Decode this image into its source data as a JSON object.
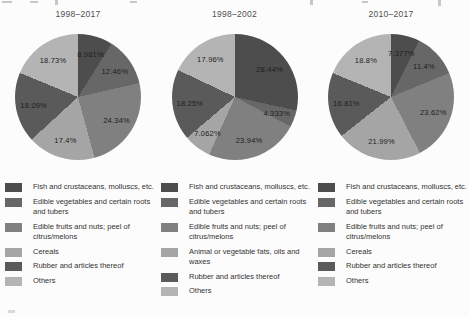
{
  "figure": {
    "background": "#fcfcfc",
    "text_color": "#333333",
    "title_color": "#4f4f4f"
  },
  "palette": {
    "fish": "#4d4d4d",
    "vegetables": "#676767",
    "fruits": "#808080",
    "light_category": "#a5a5a5",
    "rubber": "#5a5a5a",
    "others": "#b4b4b4"
  },
  "chart_data": [
    {
      "type": "pie",
      "title": "1998–2017",
      "categories": [
        "Fish and crustaceans, molluscs, etc.",
        "Edible vegetables and certain roots and tubers",
        "Edible fruits and nuts; peel of citrus/melons",
        "Cereals",
        "Rubber and articles thereof",
        "Others"
      ],
      "values": [
        8.981,
        12.46,
        24.34,
        17.4,
        18.09,
        18.73
      ],
      "value_labels": [
        "8.981%",
        "12.46%",
        "24.34%",
        "17.4%",
        "18.09%",
        "18.73%"
      ],
      "colors": [
        "#4d4d4d",
        "#676767",
        "#808080",
        "#a5a5a5",
        "#5a5a5a",
        "#b4b4b4"
      ],
      "start_angle_deg": 0,
      "direction": "clockwise",
      "legend_position": "bottom"
    },
    {
      "type": "pie",
      "title": "1998–2002",
      "categories": [
        "Fish and crustaceans, molluscs, etc.",
        "Edible vegetables and certain roots and tubers",
        "Edible fruits and nuts; peel of citrus/melons",
        "Animal or vegetable fats, oils and waxes",
        "Rubber and articles thereof",
        "Others"
      ],
      "values": [
        28.44,
        4.333,
        23.94,
        7.062,
        18.25,
        17.96
      ],
      "value_labels": [
        "28.44%",
        "4.333%",
        "23.94%",
        "7.062%",
        "18.25%",
        "17.96%"
      ],
      "colors": [
        "#4d4d4d",
        "#676767",
        "#808080",
        "#a5a5a5",
        "#5a5a5a",
        "#b4b4b4"
      ],
      "start_angle_deg": 0,
      "direction": "clockwise",
      "legend_position": "bottom"
    },
    {
      "type": "pie",
      "title": "2010–2017",
      "categories": [
        "Fish and crustaceans, molluscs, etc.",
        "Edible vegetables and certain roots and tubers",
        "Edible fruits and nuts; peel of citrus/melons",
        "Cereals",
        "Rubber and articles thereof",
        "Others"
      ],
      "values": [
        7.377,
        11.4,
        23.62,
        21.99,
        16.81,
        18.8
      ],
      "value_labels": [
        "7.377%",
        "11.4%",
        "23.62%",
        "21.99%",
        "16.81%",
        "18.8%"
      ],
      "colors": [
        "#4d4d4d",
        "#676767",
        "#808080",
        "#a5a5a5",
        "#5a5a5a",
        "#b4b4b4"
      ],
      "start_angle_deg": 0,
      "direction": "clockwise",
      "legend_position": "bottom"
    }
  ]
}
